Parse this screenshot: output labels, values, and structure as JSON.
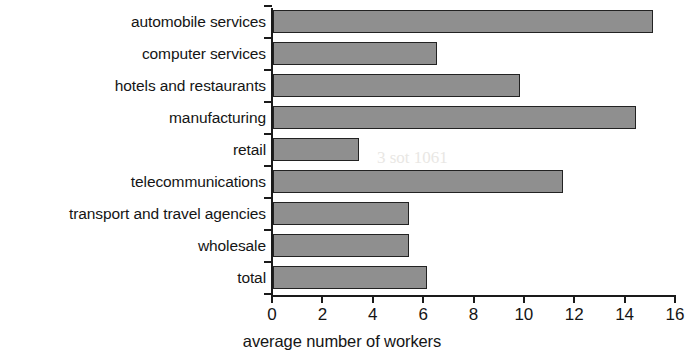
{
  "chart_data": {
    "type": "bar",
    "orientation": "horizontal",
    "title": "",
    "xlabel": "average number of workers",
    "ylabel": "",
    "xlim": [
      0,
      16
    ],
    "xticks": [
      0,
      2,
      4,
      6,
      8,
      10,
      12,
      14,
      16
    ],
    "grid": false,
    "legend": null,
    "bar_color": "#8f8f8f",
    "bar_edge_color": "#222222",
    "axis_color": "#1a1a1a",
    "categories": [
      "automobile services",
      "computer services",
      "hotels and restaurants",
      "manufacturing",
      "retail",
      "telecommunications",
      "transport and travel agencies",
      "wholesale",
      "total"
    ],
    "values": [
      15.1,
      6.5,
      9.8,
      14.4,
      3.4,
      11.5,
      5.4,
      5.4,
      6.1
    ]
  },
  "ghost_text": {
    "line1": "3 sot 1061"
  }
}
